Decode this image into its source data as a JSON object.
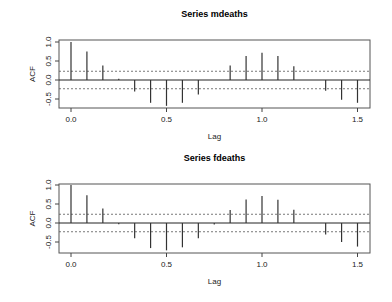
{
  "chart_data": [
    {
      "type": "bar",
      "subtype": "acf-stem",
      "title": "Series  mdeaths",
      "xlabel": "Lag",
      "ylabel": "ACF",
      "xlim": [
        -0.06,
        1.56
      ],
      "ylim": [
        -0.75,
        1.05
      ],
      "xticks": [
        "0.0",
        "0.5",
        "1.0",
        "1.5"
      ],
      "yticks": [
        "-0.5",
        "0.0",
        "0.5",
        "1.0"
      ],
      "confidence_band": 0.23,
      "grid": false,
      "x": [
        0.0,
        0.0833,
        0.1667,
        0.25,
        0.3333,
        0.4167,
        0.5,
        0.5833,
        0.6667,
        0.75,
        0.8333,
        0.9167,
        1.0,
        1.0833,
        1.1667,
        1.25,
        1.3333,
        1.4167,
        1.5
      ],
      "values": [
        1.0,
        0.75,
        0.38,
        0.03,
        -0.3,
        -0.6,
        -0.68,
        -0.6,
        -0.38,
        0.0,
        0.38,
        0.63,
        0.72,
        0.63,
        0.36,
        0.0,
        -0.28,
        -0.52,
        -0.6
      ]
    },
    {
      "type": "bar",
      "subtype": "acf-stem",
      "title": "Series  fdeaths",
      "xlabel": "Lag",
      "ylabel": "ACF",
      "xlim": [
        -0.06,
        1.56
      ],
      "ylim": [
        -0.75,
        1.05
      ],
      "xticks": [
        "0.0",
        "0.5",
        "1.0",
        "1.5"
      ],
      "yticks": [
        "-0.5",
        "0.0",
        "0.5",
        "1.0"
      ],
      "confidence_band": 0.23,
      "grid": false,
      "x": [
        0.0,
        0.0833,
        0.1667,
        0.25,
        0.3333,
        0.4167,
        0.5,
        0.5833,
        0.6667,
        0.75,
        0.8333,
        0.9167,
        1.0,
        1.0833,
        1.1667,
        1.25,
        1.3333,
        1.4167,
        1.5
      ],
      "values": [
        1.0,
        0.73,
        0.38,
        -0.03,
        -0.4,
        -0.66,
        -0.72,
        -0.64,
        -0.4,
        -0.04,
        0.34,
        0.62,
        0.71,
        0.61,
        0.35,
        0.0,
        -0.3,
        -0.5,
        -0.62
      ]
    }
  ],
  "panels": [
    {
      "title": "Series  mdeaths",
      "xlabel": "Lag",
      "ylabel": "ACF"
    },
    {
      "title": "Series  fdeaths",
      "xlabel": "Lag",
      "ylabel": "ACF"
    }
  ]
}
